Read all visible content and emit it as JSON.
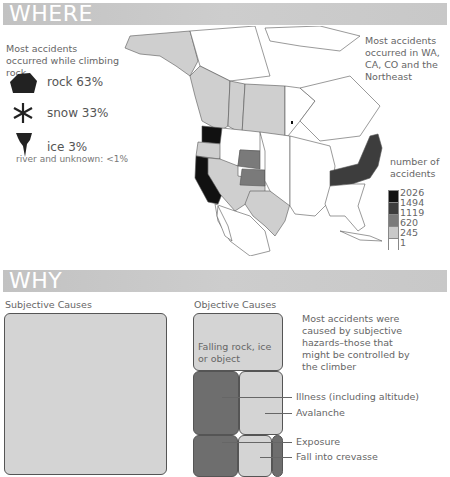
{
  "where": {
    "header": "WHERE",
    "intro": "Most accidents occurred while climbing rock",
    "types": [
      {
        "icon": "rock-icon",
        "label": "rock 63%"
      },
      {
        "icon": "snowflake-icon",
        "label": "snow 33%"
      },
      {
        "icon": "icicle-icon",
        "label": "ice 3%"
      }
    ],
    "other_note": "river and unknown: <1%",
    "map_note": "Most accidents occurred in WA, CA, CO and the Northeast",
    "legend": {
      "title": "number of accidents",
      "values": [
        "2026",
        "1494",
        "1119",
        "620",
        "245",
        "1"
      ],
      "colors": [
        "#111111",
        "#3d3d3d",
        "#7a7a7a",
        "#c9c9c9",
        "#ffffff"
      ]
    }
  },
  "why": {
    "header": "WHY",
    "subjective_title": "Subjective Causes",
    "objective_title": "Objective Causes",
    "note": "Most accidents were caused by subjective hazards–those that might be controlled by the climber",
    "objective_items": [
      {
        "label": "Falling rock, ice or object"
      },
      {
        "label": "Illness (including altitude)"
      },
      {
        "label": "Avalanche"
      },
      {
        "label": "Exposure"
      },
      {
        "label": "Fall into crevasse"
      }
    ]
  }
}
